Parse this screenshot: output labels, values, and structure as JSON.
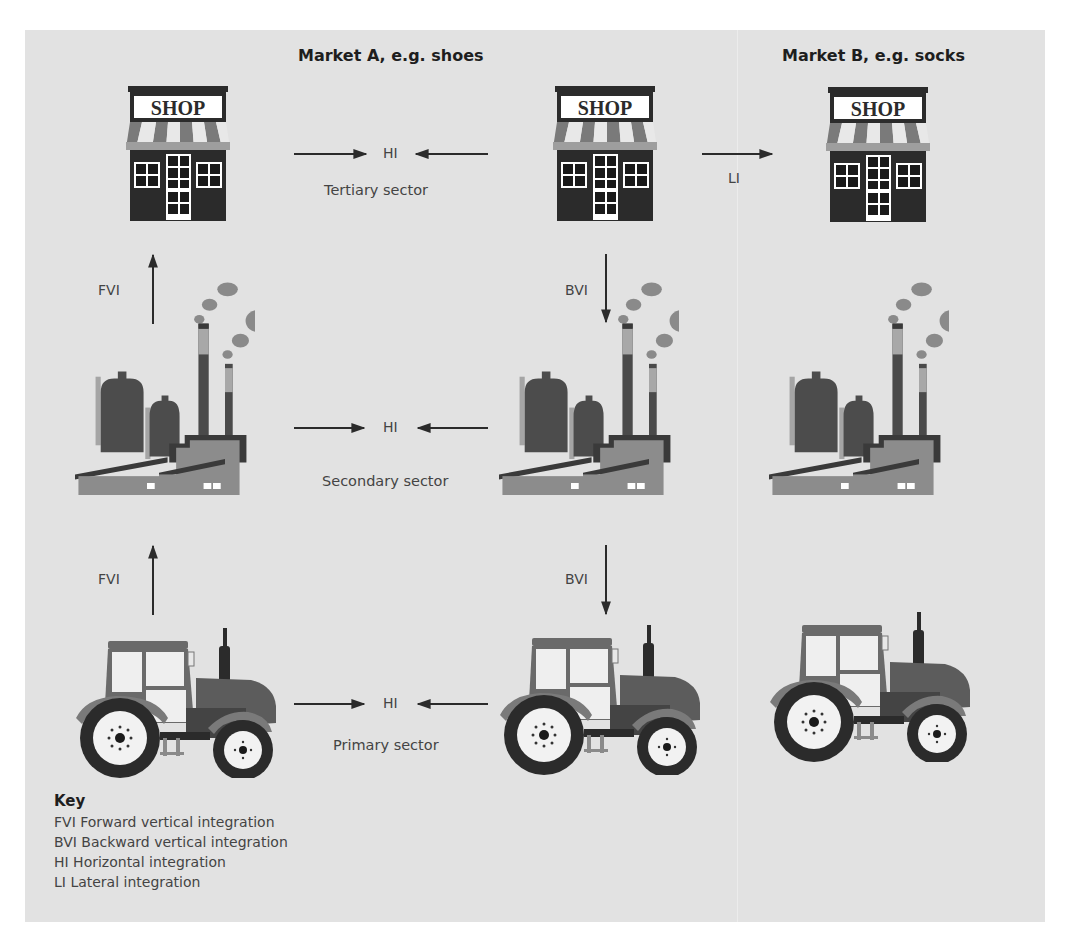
{
  "headings": {
    "market_a": "Market A, e.g. shoes",
    "market_b": "Market B, e.g. socks"
  },
  "sectors": {
    "tertiary": "Tertiary sector",
    "secondary": "Secondary sector",
    "primary": "Primary sector"
  },
  "shop_sign": "SHOP",
  "arrow_labels": {
    "hi": "HI",
    "li": "LI",
    "fvi": "FVI",
    "bvi": "BVI"
  },
  "key": {
    "title": "Key",
    "items": [
      "FVI Forward vertical integration",
      "BVI Backward vertical integration",
      "HI Horizontal integration",
      "LI Lateral integration"
    ]
  },
  "colors": {
    "background": "#e2e2e2",
    "dark": "#3a3a3a",
    "mid": "#6e6e6e",
    "light": "#9a9a9a"
  }
}
